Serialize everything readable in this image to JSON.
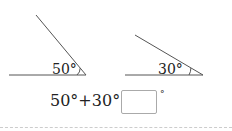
{
  "problem": {
    "angle1": {
      "label": "50°",
      "degrees": 50
    },
    "angle2": {
      "label": "30°",
      "degrees": 30
    },
    "equation": "50°+30°=",
    "answer_value": "",
    "unit": "°"
  },
  "colors": {
    "line": "#555555",
    "text": "#222222",
    "box_border": "#aaaaaa"
  }
}
